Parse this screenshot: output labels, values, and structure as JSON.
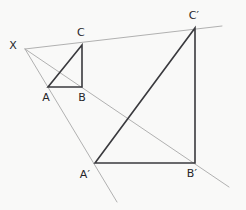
{
  "figure": {
    "type": "geometry-diagram",
    "background_color": "#f9f9f8",
    "canvas": {
      "width": 246,
      "height": 210
    }
  },
  "styles": {
    "shape_stroke_color": "#3a3a3e",
    "shape_stroke_width": 1.6,
    "ray_stroke_color": "#a8a8a8",
    "ray_stroke_width": 0.9,
    "label_color": "#26262a",
    "label_font_size": 11
  },
  "points": {
    "X": {
      "label": "X",
      "x": 25,
      "y": 49,
      "label_x": 13,
      "label_y": 49
    },
    "A": {
      "label": "A",
      "x": 48,
      "y": 87,
      "label_x": 46,
      "label_y": 101
    },
    "B": {
      "label": "B",
      "x": 82,
      "y": 87,
      "label_x": 82,
      "label_y": 101
    },
    "C": {
      "label": "C",
      "x": 82,
      "y": 45,
      "label_x": 81,
      "label_y": 36
    },
    "A_prime": {
      "label": "A′",
      "x": 95,
      "y": 163,
      "label_x": 85,
      "label_y": 178
    },
    "B_prime": {
      "label": "B′",
      "x": 195,
      "y": 163,
      "label_x": 192,
      "label_y": 177
    },
    "C_prime": {
      "label": "C′",
      "x": 195,
      "y": 28,
      "label_x": 194,
      "label_y": 19
    }
  },
  "small_triangle": {
    "name": "triangle-ABC",
    "vertices": [
      "A",
      "B",
      "C"
    ],
    "path": "M48,87 L82,87 L82,45 Z"
  },
  "large_triangle": {
    "name": "triangle-A-prime-B-prime-C-prime",
    "vertices": [
      "A_prime",
      "B_prime",
      "C_prime"
    ],
    "path": "M95,163 L195,163 L195,28 Z"
  },
  "rays": [
    {
      "name": "ray-x-through-c-to-c-prime",
      "from": "X",
      "through": "C",
      "to": "C_prime",
      "path": "M25,49 L222,26"
    },
    {
      "name": "ray-x-through-a-to-a-prime",
      "from": "X",
      "through": "A",
      "to": "A_prime",
      "path": "M25,49 L117,202"
    },
    {
      "name": "ray-x-through-b-to-b-prime",
      "from": "X",
      "through": "B",
      "to": "B_prime",
      "path": "M25,49 L229,187"
    }
  ],
  "labels_order": [
    "X",
    "C",
    "C_prime",
    "A",
    "B",
    "A_prime",
    "B_prime"
  ]
}
